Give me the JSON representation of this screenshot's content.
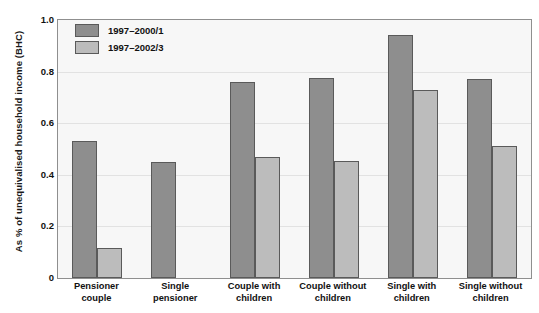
{
  "chart_data": {
    "type": "bar",
    "title": "",
    "xlabel": "",
    "ylabel": "As % of unequivalised household income (BHC)",
    "ylim": [
      0,
      1.0
    ],
    "ytick_labels": [
      "1.0",
      "0.8",
      "0.6",
      "0.4",
      "0.2",
      "0"
    ],
    "ytick_values": [
      1.0,
      0.8,
      0.6,
      0.4,
      0.2,
      0
    ],
    "grid": true,
    "legend_position": "top-left",
    "categories": [
      "Pensioner couple",
      "Single pensioner",
      "Couple with children",
      "Couple without children",
      "Single with children",
      "Single without children"
    ],
    "category_lines": [
      [
        "Pensioner",
        "couple"
      ],
      [
        "Single",
        "pensioner"
      ],
      [
        "Couple with",
        "children"
      ],
      [
        "Couple without",
        "children"
      ],
      [
        "Single with",
        "children"
      ],
      [
        "Single without",
        "children"
      ]
    ],
    "series": [
      {
        "name": "1997–2000/1",
        "color": "#8e8e8e",
        "values": [
          0.53,
          0.45,
          0.76,
          0.775,
          0.94,
          0.77
        ]
      },
      {
        "name": "1997–2002/3",
        "color": "#bcbcbc",
        "values": [
          0.115,
          null,
          0.47,
          0.455,
          0.73,
          0.51
        ]
      }
    ]
  },
  "colors": {
    "series_1997_2000": "#8e8e8e",
    "series_1997_2002": "#bcbcbc",
    "bar_border": "#5a5a5a",
    "plot_background": "#f7f7f7",
    "plot_border": "#8f8f8f",
    "gridline": "#e2e2e2",
    "text": "#111111"
  }
}
